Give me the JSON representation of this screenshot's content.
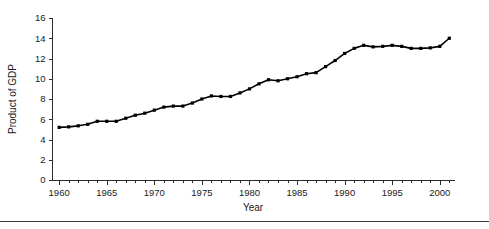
{
  "chart_data": {
    "type": "line",
    "title": "",
    "xlabel": "Year",
    "ylabel": "Product of GDP",
    "xlim": [
      1959.3,
      2001.6
    ],
    "ylim": [
      0,
      16
    ],
    "grid": false,
    "legend": null,
    "marker": "filled-square",
    "line_color": "#000000",
    "marker_color": "#000000",
    "x_ticks_major": [
      1960,
      1965,
      1970,
      1975,
      1980,
      1985,
      1990,
      1995,
      2000
    ],
    "x_tick_labels": [
      "1960",
      "1965",
      "1970",
      "1975",
      "1980",
      "1985",
      "1990",
      "1995",
      "2000"
    ],
    "x_ticks_minor_step": 1,
    "y_ticks": [
      0,
      2,
      4,
      6,
      8,
      10,
      12,
      14,
      16
    ],
    "y_tick_labels": [
      "0",
      "2",
      "4",
      "6",
      "8",
      "10",
      "12",
      "14",
      "16"
    ],
    "x": [
      1960,
      1961,
      1962,
      1963,
      1964,
      1965,
      1966,
      1967,
      1968,
      1969,
      1970,
      1971,
      1972,
      1973,
      1974,
      1975,
      1976,
      1977,
      1978,
      1979,
      1980,
      1981,
      1982,
      1983,
      1984,
      1985,
      1986,
      1987,
      1988,
      1989,
      1990,
      1991,
      1992,
      1993,
      1994,
      1995,
      1996,
      1997,
      1998,
      1999,
      2000,
      2001
    ],
    "values": [
      5.2,
      5.25,
      5.35,
      5.5,
      5.8,
      5.8,
      5.8,
      6.1,
      6.4,
      6.6,
      6.9,
      7.2,
      7.3,
      7.3,
      7.6,
      8.0,
      8.3,
      8.25,
      8.25,
      8.6,
      9.0,
      9.5,
      9.9,
      9.8,
      10.0,
      10.2,
      10.5,
      10.6,
      11.2,
      11.8,
      12.5,
      13.0,
      13.3,
      13.15,
      13.2,
      13.3,
      13.2,
      13.0,
      13.0,
      13.05,
      13.2,
      14.0
    ],
    "point_count": 42
  },
  "axis": {
    "y_title": "Product of GDP",
    "x_title": "Year"
  }
}
